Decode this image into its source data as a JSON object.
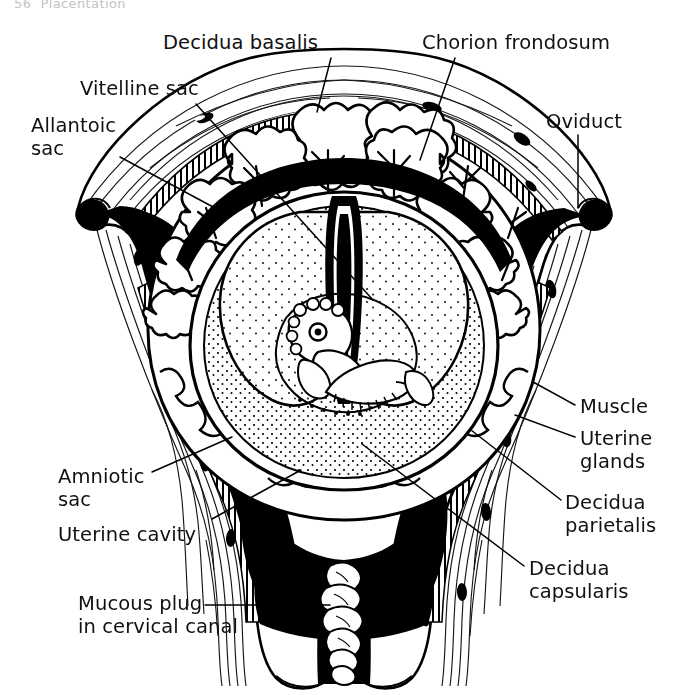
{
  "page": {
    "header_fragment": "56  Placentation",
    "figure_title": "Sagittal section of gravid uterus with early embryo"
  },
  "labels": [
    {
      "id": "decidua-basalis",
      "text": "Decidua basalis",
      "x": 163,
      "y": 31,
      "align": "left"
    },
    {
      "id": "chorion-frondosum",
      "text": "Chorion frondosum",
      "x": 422,
      "y": 31,
      "align": "left"
    },
    {
      "id": "vitelline-sac",
      "text": "Vitelline sac",
      "x": 80,
      "y": 77,
      "align": "left"
    },
    {
      "id": "oviduct",
      "text": "Oviduct",
      "x": 546,
      "y": 110,
      "align": "left"
    },
    {
      "id": "allantoic-sac",
      "text": "Allantoic\nsac",
      "x": 31,
      "y": 114,
      "align": "left"
    },
    {
      "id": "muscle",
      "text": "Muscle",
      "x": 580,
      "y": 395,
      "align": "left"
    },
    {
      "id": "uterine-glands",
      "text": "Uterine\nglands",
      "x": 580,
      "y": 427,
      "align": "left"
    },
    {
      "id": "decidua-parietalis",
      "text": "Decidua\nparietalis",
      "x": 565,
      "y": 491,
      "align": "left"
    },
    {
      "id": "decidua-capsularis",
      "text": "Decidua\ncapsularis",
      "x": 529,
      "y": 557,
      "align": "left"
    },
    {
      "id": "amniotic-sac",
      "text": "Amniotic\nsac",
      "x": 58,
      "y": 465,
      "align": "left"
    },
    {
      "id": "uterine-cavity",
      "text": "Uterine cavity",
      "x": 58,
      "y": 523,
      "align": "left"
    },
    {
      "id": "mucous-plug",
      "text": "Mucous plug\nin cervical canal",
      "x": 78,
      "y": 592,
      "align": "left"
    }
  ],
  "leaders": [
    {
      "id": "leader-decidua-basalis",
      "d": "M 331 58 L 317 112"
    },
    {
      "id": "leader-chorion-frondosum",
      "d": "M 455 58 L 420 160"
    },
    {
      "id": "leader-vitelline-sac",
      "d": "M 196 104 L 373 300"
    },
    {
      "id": "leader-oviduct",
      "d": "M 578 135 L 578 208"
    },
    {
      "id": "leader-allantoic-sac",
      "d": "M 120 157 L 228 215"
    },
    {
      "id": "leader-muscle",
      "d": "M 575 405 L 533 382"
    },
    {
      "id": "leader-uterine-glands",
      "d": "M 575 437 L 515 415"
    },
    {
      "id": "leader-decidua-parietalis",
      "d": "M 561 500 L 471 430"
    },
    {
      "id": "leader-decidua-capsularis",
      "d": "M 524 566 L 362 444"
    },
    {
      "id": "leader-amniotic-sac",
      "d": "M 152 472 L 232 437"
    },
    {
      "id": "leader-uterine-cavity",
      "d": "M 212 519 L 301 470"
    },
    {
      "id": "leader-mucous-plug",
      "d": "M 205 605 L 330 605"
    }
  ],
  "colors": {
    "ink": "#000000",
    "paper": "#ffffff",
    "cavity_fill": "#000000",
    "header_gray": "#b9b9b9"
  },
  "structures": [
    "uterus-outline",
    "myometrium-striations",
    "endometrium-glands",
    "uterine-cavity-black",
    "decidua-capsularis",
    "chorion-frondosum-villi",
    "amniotic-sac",
    "vitelline-sac",
    "allantoic-stalk",
    "embryo",
    "oviduct-left",
    "oviduct-right",
    "cervical-canal",
    "mucous-plug"
  ]
}
